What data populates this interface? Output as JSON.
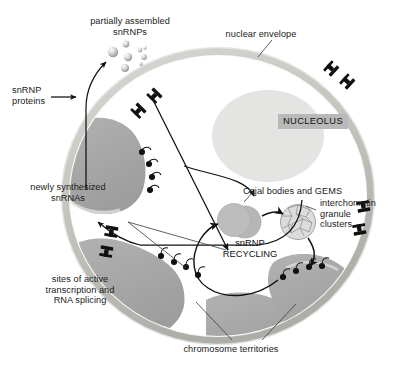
{
  "figure": {
    "title_region": "nucleus diagram of snRNP assembly and recycling",
    "labels": {
      "partially_assembled": "partially assembled\nsnRNPs",
      "nuclear_envelope": "nuclear envelope",
      "snrnp_proteins": "snRNP\nproteins",
      "newly_synthesized": "newly synthesized\nsnRNAs",
      "nucleolus": "NUCLEOLUS",
      "cajal": "Cajal bodies and GEMS",
      "igc": "interchomatin\ngranule\nclusters",
      "recycling": "snRNP\nRECYCLING",
      "sites_active": "sites of active\ntranscription and\nRNA splicing",
      "chromosome_territories": "chromosome territories"
    },
    "colors": {
      "envelope": "#c9c9c4",
      "envelope_dark": "#b0b0aa",
      "nucleolus_fill": "#e4e4e2",
      "nucleolus_label_bg": "#b9b9b9",
      "chromosome_fill": "#a8a8a8",
      "cajal_fill": "#b4b4b4",
      "igc_fill": "#d8d8d8",
      "arrow": "#111111",
      "text": "#1a1a1a",
      "sphere_light": "#f2f2f2",
      "sphere_dark": "#8d8d8d"
    },
    "icons": {
      "nuclear_pore": "nuclear-pore-icon",
      "transcription_site": "transcription-site-icon",
      "snrnp_particle": "snrnp-particle-icon"
    },
    "counts": {
      "nuclear_pores": 6,
      "snrnp_particles": 8,
      "chromosome_territories": 4
    }
  }
}
